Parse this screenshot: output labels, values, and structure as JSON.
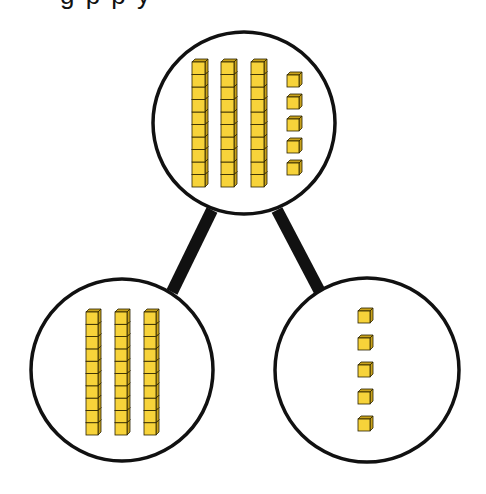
{
  "diagram": {
    "type": "number-bond",
    "caption_partial": "g p                              p y",
    "colors": {
      "cube_face": "#F7D33A",
      "cube_side": "#C9A21C",
      "cube_outline": "#2a2200",
      "circle_stroke": "#111111",
      "connector": "#111111",
      "background": "#ffffff"
    },
    "whole": {
      "label": "Whole",
      "value": 35,
      "tens": 3,
      "ones": 5,
      "circle": {
        "cx": 244,
        "cy": 123,
        "r": 91
      },
      "rods_x": [
        192,
        221,
        251
      ],
      "rods_top": 60,
      "ones_x": 287,
      "ones_y": [
        73,
        95,
        117,
        139,
        161
      ]
    },
    "parts": [
      {
        "label": "Part (tens)",
        "value": 30,
        "tens": 3,
        "ones": 0,
        "circle": {
          "cx": 122,
          "cy": 370,
          "r": 91
        },
        "rods_x": [
          86,
          115,
          144
        ],
        "rods_top": 310
      },
      {
        "label": "Part (ones)",
        "value": 5,
        "tens": 0,
        "ones": 5,
        "circle": {
          "cx": 367,
          "cy": 370,
          "r": 92
        },
        "ones_x": 358,
        "ones_y": [
          309,
          336,
          363,
          390,
          417
        ]
      }
    ],
    "connectors": [
      {
        "from": "whole",
        "to": "part-tens",
        "x1": 212,
        "y1": 210,
        "x2": 172,
        "y2": 292
      },
      {
        "from": "whole",
        "to": "part-ones",
        "x1": 277,
        "y1": 210,
        "x2": 320,
        "y2": 292
      }
    ],
    "labels": {
      "whole_desc": "Whole: 3 tens and 5 ones (35)",
      "part_tens_desc": "Part: 3 tens (30)",
      "part_ones_desc": "Part: 5 ones (5)"
    }
  }
}
